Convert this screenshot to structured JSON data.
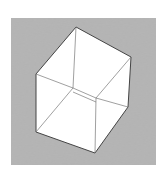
{
  "illustration": {
    "subject": "ambiguous-cube-drawing",
    "background_color": "#ffffff",
    "frame": {
      "x": 11,
      "y": 18,
      "width": 145,
      "height": 147,
      "fill": "#8a8a8a"
    },
    "cube_fill": "#ffffff",
    "line_color": "#555555",
    "outline": [
      [
        76,
        27
      ],
      [
        131,
        57
      ],
      [
        128,
        107
      ],
      [
        95,
        153
      ],
      [
        36,
        132
      ],
      [
        36,
        74
      ]
    ],
    "inner_vertices": {
      "a": [
        73,
        88
      ],
      "b": [
        96,
        98
      ]
    }
  }
}
